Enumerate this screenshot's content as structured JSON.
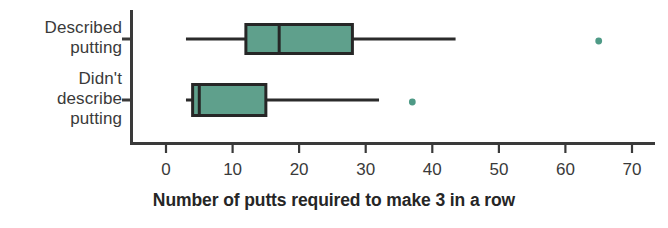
{
  "chart_data": {
    "type": "boxplot",
    "title": "",
    "xlabel": "Number of putts required to make 3 in a row",
    "ylabel": "",
    "orientation": "horizontal",
    "xlim": [
      -2,
      72
    ],
    "xticks": [
      0,
      10,
      20,
      30,
      40,
      50,
      60,
      70
    ],
    "xticklabels": [
      "0",
      "10",
      "20",
      "30",
      "40",
      "50",
      "60",
      "70"
    ],
    "grid": false,
    "legend": "none",
    "categories": [
      "Described putting",
      "Didn't describe putting"
    ],
    "series": [
      {
        "name": "Described putting",
        "label_lines": "Described\nputting",
        "whisker_low": 3,
        "q1": 12,
        "median": 17,
        "q3": 28,
        "whisker_high": 43.5,
        "outliers": [
          65
        ]
      },
      {
        "name": "Didn't describe putting",
        "label_lines": "Didn't\ndescribe\nputting",
        "whisker_low": 3,
        "q1": 4,
        "median": 5,
        "q3": 15,
        "whisker_high": 32,
        "outliers": [
          37
        ]
      }
    ]
  },
  "colors": {
    "box_fill": "#5fa08c",
    "box_stroke": "#262626",
    "whisker": "#2b2b2b",
    "axis": "#3a3a3a",
    "outlier": "#4e9a86",
    "text": "#3a3a3a",
    "title_text": "#262626",
    "background": "#ffffff"
  },
  "axis": {
    "title": "Number of putts required to make 3 in a row",
    "tick_0": "0",
    "tick_1": "10",
    "tick_2": "20",
    "tick_3": "30",
    "tick_4": "40",
    "tick_5": "50",
    "tick_6": "60",
    "tick_7": "70"
  }
}
